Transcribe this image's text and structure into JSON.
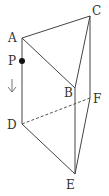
{
  "figure": {
    "type": "triangular-prism",
    "vertices": {
      "A": {
        "label": "A",
        "x": 22,
        "y": 38,
        "lx": 8,
        "ly": 42
      },
      "B": {
        "label": "B",
        "x": 75,
        "y": 88,
        "lx": 64,
        "ly": 97
      },
      "C": {
        "label": "C",
        "x": 90,
        "y": 16,
        "lx": 92,
        "ly": 15
      },
      "D": {
        "label": "D",
        "x": 22,
        "y": 124,
        "lx": 7,
        "ly": 129
      },
      "E": {
        "label": "E",
        "x": 75,
        "y": 174,
        "lx": 66,
        "ly": 188
      },
      "F": {
        "label": "F",
        "x": 90,
        "y": 98,
        "lx": 93,
        "ly": 103
      }
    },
    "point_P": {
      "label": "P",
      "x": 22,
      "y": 61,
      "lx": 8,
      "ly": 65
    },
    "arrow": {
      "direction": "down",
      "x": 12,
      "y1": 79,
      "y2": 92
    },
    "edges_visible": [
      "AB",
      "AC",
      "BC",
      "AD",
      "BE",
      "CF",
      "DE",
      "EF"
    ],
    "edges_hidden": [
      "DF"
    ],
    "colors": {
      "line": "#444444",
      "text": "#333333",
      "point": "#111111"
    }
  }
}
